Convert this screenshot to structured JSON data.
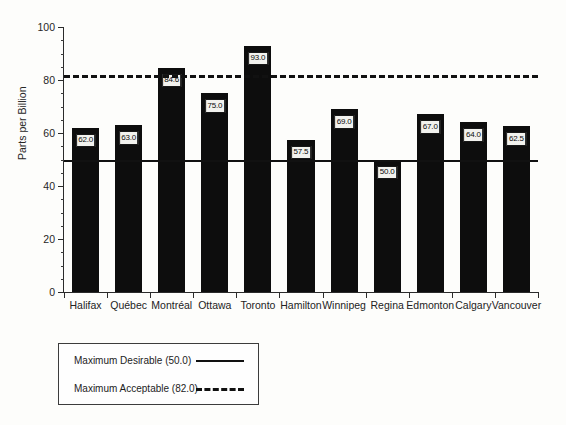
{
  "chart_data": {
    "type": "bar",
    "title": "",
    "xlabel": "",
    "ylabel": "Parts per Billion",
    "ylim": [
      0,
      100
    ],
    "ytick_labels": [
      "0",
      "20",
      "40",
      "60",
      "80",
      "100"
    ],
    "ytick_values": [
      0,
      20,
      40,
      60,
      80,
      100
    ],
    "grid": false,
    "legend_position": "below-plot-left",
    "categories": [
      "Halifax",
      "Québec",
      "Montréal",
      "Ottawa",
      "Toronto",
      "Hamilton",
      "Winnipeg",
      "Regina",
      "Edmonton",
      "Calgary",
      "Vancouver"
    ],
    "values": [
      62.0,
      63.0,
      84.6,
      75.0,
      93.0,
      57.5,
      69.0,
      50.0,
      67.0,
      64.0,
      62.5
    ],
    "value_labels": [
      "62.0",
      "63.0",
      "84.6",
      "75.0",
      "93.0",
      "57.5",
      "69.0",
      "50.0",
      "67.0",
      "64.0",
      "62.5"
    ],
    "bar_color": "#0d0d0d",
    "reference_lines": [
      {
        "name": "Maximum Desirable",
        "value": 50.0,
        "style": "solid",
        "label": "Maximum Desirable (50.0)",
        "color": "#111111"
      },
      {
        "name": "Maximum Acceptable",
        "value": 82.0,
        "style": "dashed",
        "label": "Maximum Acceptable (82.0)",
        "color": "#111111"
      }
    ]
  },
  "legend": {
    "items": [
      {
        "label": "Maximum Desirable (50.0)",
        "style": "solid"
      },
      {
        "label": "Maximum Acceptable (82.0)",
        "style": "dashed"
      }
    ]
  },
  "axis": {
    "y_title": "Parts per Billion"
  }
}
